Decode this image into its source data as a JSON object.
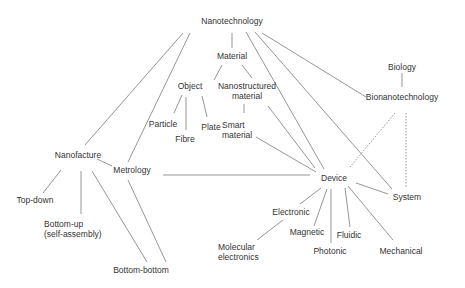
{
  "diagram": {
    "title": "Nanotechnology",
    "nodes": {
      "nanotechnology": {
        "label": "Nanotechnology",
        "x": 232,
        "y": 21
      },
      "material": {
        "label": "Material",
        "x": 232,
        "y": 56
      },
      "object": {
        "label": "Object",
        "x": 190,
        "y": 86
      },
      "nanostructured_material": {
        "label": "Nanostructured\nmaterial",
        "x": 247,
        "y": 91
      },
      "particle": {
        "label": "Particle",
        "x": 163,
        "y": 124
      },
      "fibre": {
        "label": "Fibre",
        "x": 185,
        "y": 139
      },
      "plate": {
        "label": "Plate",
        "x": 211,
        "y": 127
      },
      "smart_material": {
        "label": "Smart\nmaterial",
        "x": 244,
        "y": 130
      },
      "biology": {
        "label": "Biology",
        "x": 402,
        "y": 67
      },
      "bionanotechnology": {
        "label": "Bionanotechnology",
        "x": 402,
        "y": 97
      },
      "nanofacture": {
        "label": "Nanofacture",
        "x": 78,
        "y": 155
      },
      "metrology": {
        "label": "Metrology",
        "x": 132,
        "y": 170
      },
      "device": {
        "label": "Device",
        "x": 334,
        "y": 178
      },
      "system": {
        "label": "System",
        "x": 407,
        "y": 197
      },
      "top_down": {
        "label": "Top-down",
        "x": 35,
        "y": 200
      },
      "bottom_up": {
        "label": "Bottom-up\n(self-assembly)",
        "x": 66,
        "y": 229
      },
      "bottom_bottom": {
        "label": "Bottom-bottom",
        "x": 141,
        "y": 270
      },
      "electronic": {
        "label": "Electronic",
        "x": 291,
        "y": 212
      },
      "magnetic": {
        "label": "Magnetic",
        "x": 307,
        "y": 232
      },
      "fluidic": {
        "label": "Fluidic",
        "x": 349,
        "y": 235
      },
      "photonic": {
        "label": "Photonic",
        "x": 330,
        "y": 251
      },
      "mechanical": {
        "label": "Mechanical",
        "x": 401,
        "y": 251
      },
      "molecular_electronics": {
        "label": "Molecular\nelectronics",
        "x": 240,
        "y": 252
      }
    },
    "edges": [
      {
        "x1": 232,
        "y1": 33,
        "x2": 232,
        "y2": 48,
        "style": "solid"
      },
      {
        "x1": 222,
        "y1": 65,
        "x2": 214,
        "y2": 80,
        "style": "solid"
      },
      {
        "x1": 242,
        "y1": 65,
        "x2": 252,
        "y2": 78,
        "style": "solid"
      },
      {
        "x1": 182,
        "y1": 95,
        "x2": 174,
        "y2": 113,
        "style": "solid"
      },
      {
        "x1": 186,
        "y1": 97,
        "x2": 186,
        "y2": 130,
        "style": "solid"
      },
      {
        "x1": 202,
        "y1": 96,
        "x2": 207,
        "y2": 117,
        "style": "solid"
      },
      {
        "x1": 244,
        "y1": 104,
        "x2": 244,
        "y2": 113,
        "style": "solid"
      },
      {
        "x1": 402,
        "y1": 73,
        "x2": 402,
        "y2": 87,
        "style": "solid"
      },
      {
        "x1": 183,
        "y1": 33,
        "x2": 85,
        "y2": 145,
        "style": "solid"
      },
      {
        "x1": 190,
        "y1": 33,
        "x2": 128,
        "y2": 162,
        "style": "solid"
      },
      {
        "x1": 246,
        "y1": 32,
        "x2": 324,
        "y2": 169,
        "style": "solid"
      },
      {
        "x1": 255,
        "y1": 32,
        "x2": 392,
        "y2": 189,
        "style": "solid"
      },
      {
        "x1": 262,
        "y1": 33,
        "x2": 366,
        "y2": 97,
        "style": "solid"
      },
      {
        "x1": 268,
        "y1": 106,
        "x2": 315,
        "y2": 168,
        "style": "solid"
      },
      {
        "x1": 256,
        "y1": 137,
        "x2": 316,
        "y2": 172,
        "style": "solid"
      },
      {
        "x1": 163,
        "y1": 175,
        "x2": 310,
        "y2": 175,
        "style": "solid"
      },
      {
        "x1": 97,
        "y1": 159,
        "x2": 112,
        "y2": 166,
        "style": "solid"
      },
      {
        "x1": 61,
        "y1": 170,
        "x2": 43,
        "y2": 193,
        "style": "solid"
      },
      {
        "x1": 81,
        "y1": 171,
        "x2": 81,
        "y2": 214,
        "style": "solid"
      },
      {
        "x1": 92,
        "y1": 171,
        "x2": 147,
        "y2": 262,
        "style": "solid"
      },
      {
        "x1": 128,
        "y1": 180,
        "x2": 166,
        "y2": 262,
        "style": "solid"
      },
      {
        "x1": 395,
        "y1": 113,
        "x2": 350,
        "y2": 167,
        "style": "dotted"
      },
      {
        "x1": 406,
        "y1": 113,
        "x2": 406,
        "y2": 187,
        "style": "dotted"
      },
      {
        "x1": 356,
        "y1": 183,
        "x2": 388,
        "y2": 194,
        "style": "solid"
      },
      {
        "x1": 321,
        "y1": 188,
        "x2": 300,
        "y2": 204,
        "style": "solid"
      },
      {
        "x1": 327,
        "y1": 189,
        "x2": 314,
        "y2": 226,
        "style": "solid"
      },
      {
        "x1": 331,
        "y1": 189,
        "x2": 331,
        "y2": 243,
        "style": "solid"
      },
      {
        "x1": 345,
        "y1": 188,
        "x2": 350,
        "y2": 227,
        "style": "solid"
      },
      {
        "x1": 348,
        "y1": 186,
        "x2": 393,
        "y2": 240,
        "style": "solid"
      },
      {
        "x1": 283,
        "y1": 220,
        "x2": 257,
        "y2": 240,
        "style": "solid"
      }
    ]
  }
}
